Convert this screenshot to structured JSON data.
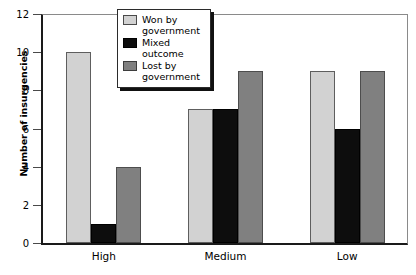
{
  "chart_data": {
    "type": "bar",
    "title": "",
    "subtitle": "",
    "xlabel": "",
    "ylabel": "Number of insurgencies",
    "categories": [
      "High",
      "Medium",
      "Low"
    ],
    "series": [
      {
        "name": "Won by government",
        "color": "#d2d2d2",
        "values": [
          10,
          7,
          9
        ]
      },
      {
        "name": "Mixed outcome",
        "color": "#0d0d0d",
        "values": [
          1,
          7,
          6
        ]
      },
      {
        "name": "Lost by government",
        "color": "#808080",
        "values": [
          4,
          9,
          9
        ]
      }
    ],
    "ylim": [
      0,
      12
    ],
    "ytick_values": [
      0,
      2,
      4,
      6,
      8,
      10,
      12
    ],
    "ytick_labels": [
      "0",
      "2",
      "4",
      "6",
      "8",
      "10",
      "12"
    ],
    "grid": false,
    "legend_position": "top-center"
  },
  "legend": {
    "entries": [
      {
        "label": "Won by government",
        "swatch": "won"
      },
      {
        "label": "Mixed outcome",
        "swatch": "mixed"
      },
      {
        "label": "Lost by government",
        "swatch": "lost"
      }
    ]
  }
}
